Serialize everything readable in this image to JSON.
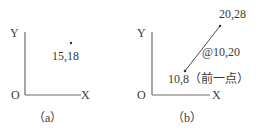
{
  "panels": [
    {
      "id": "a",
      "caption": "（a）",
      "axis_y_label": "Y",
      "axis_x_label": "X",
      "origin_label": "O",
      "point": {
        "label": "15,18"
      }
    },
    {
      "id": "b",
      "caption": "（b）",
      "axis_y_label": "Y",
      "axis_x_label": "X",
      "origin_label": "O",
      "end_point": {
        "label": "20,28"
      },
      "relative_offset": {
        "label": "@10,20"
      },
      "start_point": {
        "label": "10,8（前一点）"
      }
    }
  ],
  "colors": {
    "axis": "#6a6a6a",
    "text": "#3a3a3a",
    "line": "#4a4a4a"
  }
}
